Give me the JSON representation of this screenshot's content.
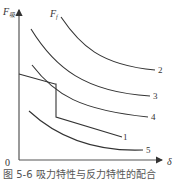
{
  "figure": {
    "y_axis_label": "F",
    "y_axis_subscript": "吸",
    "x_axis_label": "δ",
    "origin_label": "0",
    "reaction_curve_label": "F",
    "reaction_curve_subscript": "f",
    "caption": "图 5-6   吸力特性与反力特性的配合"
  },
  "curves": [
    {
      "id": "1",
      "label": "1",
      "kind": "reaction-force (step polyline)"
    },
    {
      "id": "2",
      "label": "2",
      "kind": "attraction"
    },
    {
      "id": "3",
      "label": "3",
      "kind": "attraction"
    },
    {
      "id": "4",
      "label": "4",
      "kind": "attraction"
    },
    {
      "id": "5",
      "label": "5",
      "kind": "attraction"
    }
  ],
  "colors": {
    "line": "#333333",
    "background": "#ffffff"
  }
}
